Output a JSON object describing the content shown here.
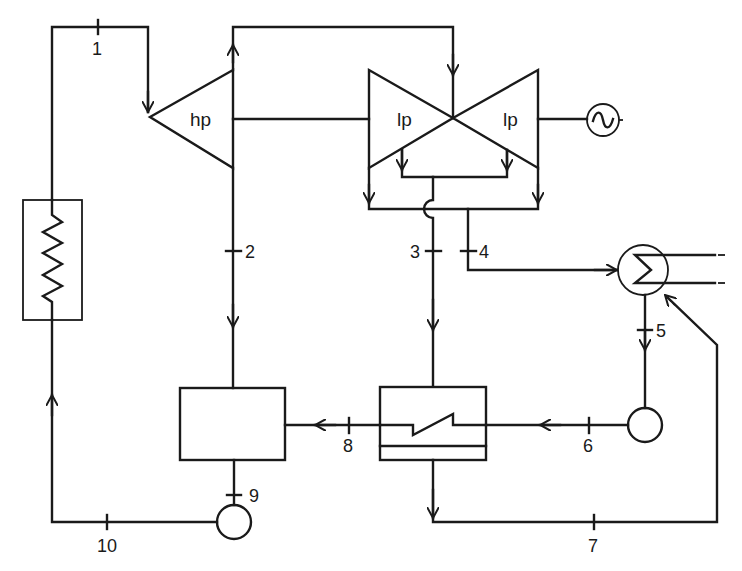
{
  "diagram": {
    "type": "steam power plant cycle schematic (regenerative Rankine cycle)",
    "colors": {
      "line": "#1a1a1a",
      "background": "#ffffff"
    },
    "components": {
      "boiler": {
        "label": "",
        "icon": "heater-zigzag"
      },
      "hp_turbine": {
        "label": "hp"
      },
      "lp_turbine_left": {
        "label": "lp"
      },
      "lp_turbine_right": {
        "label": "lp"
      },
      "generator": {
        "label": "",
        "icon": "generator-sine-wave"
      },
      "condenser": {
        "label": "",
        "icon": "condenser-coil"
      },
      "condensate_pump": {
        "label": ""
      },
      "closed_feedwater_heater": {
        "label": ""
      },
      "open_feedwater_heater": {
        "label": ""
      },
      "feed_pump": {
        "label": ""
      }
    },
    "state_points": {
      "p1": "1",
      "p2": "2",
      "p3": "3",
      "p4": "4",
      "p5": "5",
      "p6": "6",
      "p7": "7",
      "p8": "8",
      "p9": "9",
      "p10": "10"
    }
  }
}
